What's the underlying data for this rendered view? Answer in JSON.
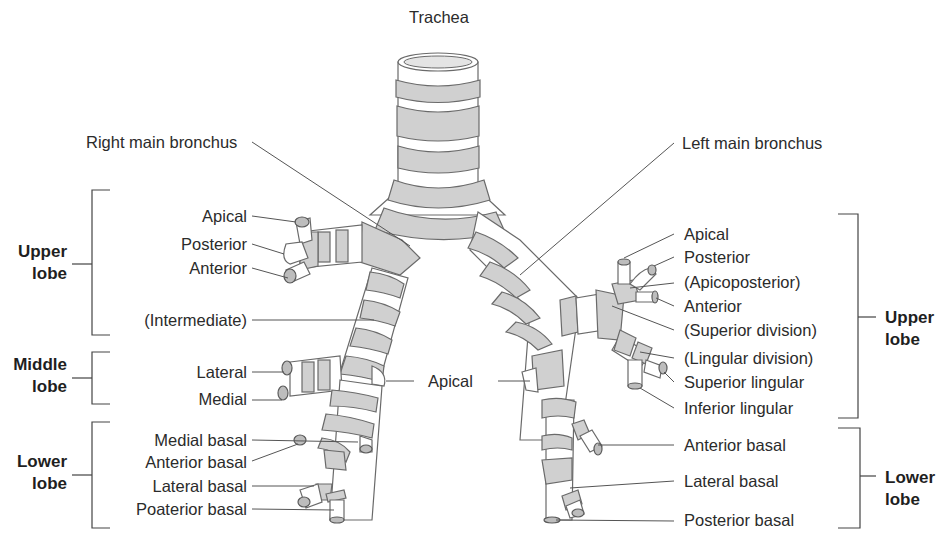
{
  "title": "Trachea",
  "colors": {
    "cartilage": "#d0d0d0",
    "outline": "#6a6a6a",
    "text": "#2b2b2b",
    "background": "#ffffff"
  },
  "main_labels": {
    "trachea": "Trachea",
    "right_main_bronchus": "Right main bronchus",
    "left_main_bronchus": "Left main bronchus"
  },
  "right_lung": {
    "upper_lobe": {
      "label": "Upper lobe",
      "line1": "Upper",
      "line2": "lobe",
      "segments": [
        "Apical",
        "Posterior",
        "Anterior"
      ]
    },
    "intermediate": "(Intermediate)",
    "middle_lobe": {
      "label": "Middle lobe",
      "line1": "Middle",
      "line2": "lobe",
      "segments": [
        "Lateral",
        "Medial"
      ]
    },
    "lower_lobe": {
      "label": "Lower lobe",
      "line1": "Lower",
      "line2": "lobe",
      "segments": [
        "Medial basal",
        "Anterior basal",
        "Lateral basal",
        "Poaterior basal"
      ]
    }
  },
  "center_labels": {
    "apical": "Apical"
  },
  "left_lung": {
    "upper_lobe": {
      "label": "Upper lobe",
      "line1": "Upper",
      "line2": "lobe",
      "segments": [
        "Apical",
        "Posterior",
        "(Apicoposterior)",
        "Anterior",
        "(Superior division)",
        "(Lingular division)",
        "Superior lingular",
        "Inferior lingular"
      ]
    },
    "lower_lobe": {
      "label": "Lower lobe",
      "line1": "Lower",
      "line2": "lobe",
      "segments": [
        "Anterior basal",
        "Lateral basal",
        "Posterior basal"
      ]
    }
  }
}
